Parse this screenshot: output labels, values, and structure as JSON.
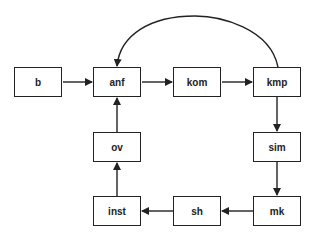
{
  "diagram": {
    "type": "flowchart",
    "colors": {
      "stroke": "#222222",
      "fill": "#ffffff",
      "text": "#222222"
    },
    "nodes": [
      {
        "id": "b",
        "label": "b",
        "x": 14,
        "y": 67
      },
      {
        "id": "anf",
        "label": "anf",
        "x": 93,
        "y": 67
      },
      {
        "id": "kom",
        "label": "kom",
        "x": 173,
        "y": 67
      },
      {
        "id": "kmp",
        "label": "kmp",
        "x": 253,
        "y": 67
      },
      {
        "id": "sim",
        "label": "sim",
        "x": 253,
        "y": 132
      },
      {
        "id": "mk",
        "label": "mk",
        "x": 253,
        "y": 196
      },
      {
        "id": "sh",
        "label": "sh",
        "x": 173,
        "y": 196
      },
      {
        "id": "inst",
        "label": "inst",
        "x": 93,
        "y": 196
      },
      {
        "id": "ov",
        "label": "ov",
        "x": 93,
        "y": 132
      }
    ],
    "edges": [
      {
        "from": "b",
        "to": "anf"
      },
      {
        "from": "anf",
        "to": "kom"
      },
      {
        "from": "kom",
        "to": "kmp"
      },
      {
        "from": "kmp",
        "to": "sim"
      },
      {
        "from": "sim",
        "to": "mk"
      },
      {
        "from": "mk",
        "to": "sh"
      },
      {
        "from": "sh",
        "to": "inst"
      },
      {
        "from": "inst",
        "to": "ov"
      },
      {
        "from": "ov",
        "to": "anf"
      },
      {
        "from": "kmp",
        "to": "anf",
        "style": "curved-arc-over-top"
      }
    ]
  }
}
